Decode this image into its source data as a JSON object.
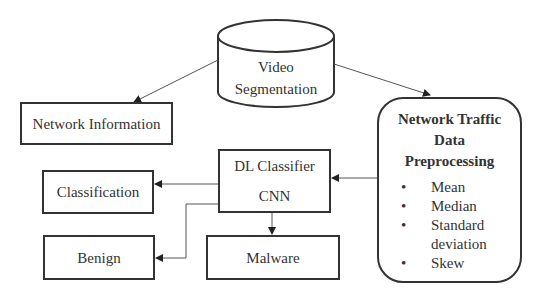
{
  "diagram": {
    "nodes": {
      "video_segmentation": {
        "line1": "Video",
        "line2": "Segmentation",
        "shape": "cylinder"
      },
      "network_information": {
        "label": "Network Information",
        "shape": "rectangle"
      },
      "network_traffic": {
        "title_line1": "Network Traffic",
        "title_line2": "Data",
        "title_line3": "Preprocessing",
        "shape": "rounded-rectangle",
        "bullet": "•",
        "items": [
          "Mean",
          "Median",
          "Standard",
          "deviation",
          "Skew"
        ]
      },
      "dl_classifier": {
        "line1": "DL Classifier",
        "line2": "CNN",
        "shape": "rectangle"
      },
      "classification": {
        "label": "Classification",
        "shape": "rectangle"
      },
      "benign": {
        "label": "Benign",
        "shape": "rectangle"
      },
      "malware": {
        "label": "Malware",
        "shape": "rectangle"
      }
    },
    "edges": [
      {
        "from": "Video Segmentation",
        "to": "Network Information"
      },
      {
        "from": "Video Segmentation",
        "to": "Network Traffic Data Preprocessing"
      },
      {
        "from": "Network Traffic Data Preprocessing",
        "to": "DL Classifier CNN"
      },
      {
        "from": "DL Classifier CNN",
        "to": "Classification"
      },
      {
        "from": "DL Classifier CNN",
        "to": "Benign"
      },
      {
        "from": "DL Classifier CNN",
        "to": "Malware"
      }
    ],
    "colors": {
      "stroke": "#333333",
      "line": "#555555",
      "background": "#ffffff"
    }
  }
}
